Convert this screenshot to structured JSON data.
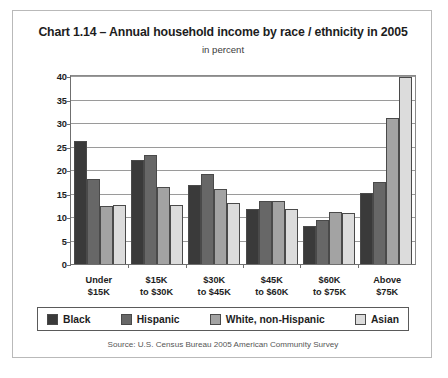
{
  "figure": {
    "title": "Chart 1.14 – Annual household income by race / ethnicity in 2005",
    "subtitle": "in percent",
    "source": "Source: U.S. Census Bureau 2005 American Community Survey"
  },
  "chart_data": {
    "type": "bar",
    "title": "Chart 1.14 – Annual household income by race / ethnicity in 2005",
    "subtitle": "in percent",
    "xlabel": "",
    "ylabel": "in percent",
    "ylim": [
      0,
      40
    ],
    "ytick_labels": [
      "0",
      "5",
      "10",
      "15",
      "20",
      "25",
      "30",
      "35",
      "40"
    ],
    "yticks": [
      0,
      5,
      10,
      15,
      20,
      25,
      30,
      35,
      40
    ],
    "grid": true,
    "legend_position": "bottom",
    "categories": [
      "Under $15K",
      "$15K to $30K",
      "$30K to $45K",
      "$45K to $60K",
      "$60K to $75K",
      "Above $75K"
    ],
    "category_lines": [
      [
        "Under",
        "$15K"
      ],
      [
        "$15K",
        "to $30K"
      ],
      [
        "$30K",
        "to $45K"
      ],
      [
        "$45K",
        "to $60K"
      ],
      [
        "$60K",
        "to $75K"
      ],
      [
        "Above",
        "$75K"
      ]
    ],
    "series": [
      {
        "name": "Black",
        "color": "#3a3a3a",
        "values": [
          26.2,
          22.2,
          16.9,
          11.6,
          8.0,
          15.2
        ]
      },
      {
        "name": "Hispanic",
        "color": "#676767",
        "values": [
          18.0,
          23.1,
          19.2,
          13.4,
          9.4,
          17.4
        ]
      },
      {
        "name": "White, non-Hispanic",
        "color": "#a3a3a3",
        "values": [
          12.3,
          16.4,
          16.0,
          13.5,
          11.0,
          31.1
        ]
      },
      {
        "name": "Asian",
        "color": "#dcdcdc",
        "values": [
          12.6,
          12.5,
          13.0,
          11.6,
          10.9,
          39.7
        ]
      }
    ]
  }
}
